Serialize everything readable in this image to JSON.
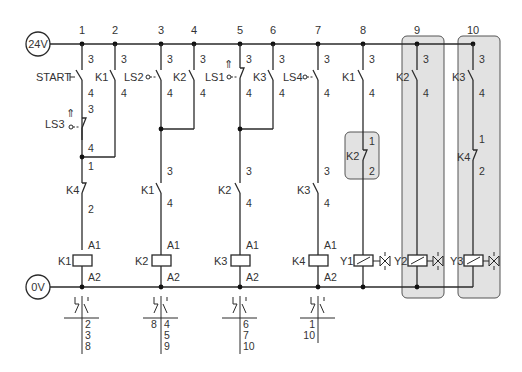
{
  "rails": {
    "supply_label": "24V",
    "ground_label": "0V"
  },
  "columns": [
    "1",
    "2",
    "3",
    "4",
    "5",
    "6",
    "7",
    "8",
    "9",
    "10"
  ],
  "contacts": {
    "start": {
      "name": "START",
      "top": "3",
      "bottom": "4"
    },
    "k1_hold": {
      "name": "K1",
      "top": "3",
      "bottom": "4"
    },
    "ls2": {
      "name": "LS2",
      "top": "3",
      "bottom": "4"
    },
    "k2_hold": {
      "name": "K2",
      "top": "3",
      "bottom": "4"
    },
    "ls1": {
      "name": "LS1",
      "top": "3",
      "bottom": "4"
    },
    "k3_hold": {
      "name": "K3",
      "top": "3",
      "bottom": "4"
    },
    "ls4": {
      "name": "LS4",
      "top": "3",
      "bottom": "4"
    },
    "k1_col8": {
      "name": "K1",
      "top": "3",
      "bottom": "4"
    },
    "k2_col9": {
      "name": "K2",
      "top": "3",
      "bottom": "4"
    },
    "k3_col10": {
      "name": "K3",
      "top": "3",
      "bottom": "4"
    },
    "ls3": {
      "name": "LS3",
      "top": "3",
      "bottom": "4"
    },
    "k4_nc_col1": {
      "name": "K4",
      "top": "1",
      "bottom": "2"
    },
    "k1_series": {
      "name": "K1",
      "top": "3",
      "bottom": "4"
    },
    "k2_series": {
      "name": "K2",
      "top": "3",
      "bottom": "4"
    },
    "k3_series": {
      "name": "K3",
      "top": "3",
      "bottom": "4"
    },
    "k2_nc_col8": {
      "name": "K2",
      "top": "1",
      "bottom": "2"
    },
    "k4_nc_col10": {
      "name": "K4",
      "top": "1",
      "bottom": "2"
    }
  },
  "coils": [
    {
      "name": "K1",
      "a1": "A1",
      "a2": "A2"
    },
    {
      "name": "K2",
      "a1": "A1",
      "a2": "A2"
    },
    {
      "name": "K3",
      "a1": "A1",
      "a2": "A2"
    },
    {
      "name": "K4",
      "a1": "A1",
      "a2": "A2"
    }
  ],
  "valves": [
    {
      "name": "Y1"
    },
    {
      "name": "Y2"
    },
    {
      "name": "Y3"
    }
  ],
  "cross_refs": [
    {
      "relay": "K1",
      "nc": [],
      "no": [
        "2",
        "3",
        "8"
      ]
    },
    {
      "relay": "K2",
      "nc": [
        "8"
      ],
      "no": [
        "4",
        "5",
        "9"
      ]
    },
    {
      "relay": "K3",
      "nc": [],
      "no": [
        "6",
        "7",
        "10"
      ]
    },
    {
      "relay": "K4",
      "nc": [
        "1",
        "10"
      ],
      "no": []
    }
  ],
  "colors": {
    "line": "#2a2a2a",
    "highlight_fill": "#e2e2e2",
    "highlight_border": "#555555"
  }
}
